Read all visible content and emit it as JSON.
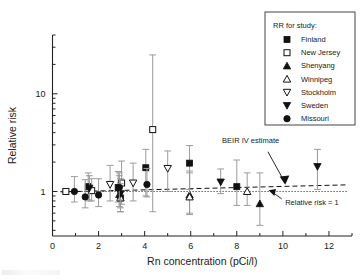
{
  "chart_data": {
    "type": "scatter",
    "title": "",
    "xlabel": "Rn concentration (pCi/l)",
    "ylabel": "Relative risk",
    "xlim": [
      0,
      13
    ],
    "ylim": [
      0.35,
      40
    ],
    "yscale": "log",
    "grid": false,
    "xticks": [
      0,
      2,
      4,
      6,
      8,
      10,
      12
    ],
    "xtick_labels": [
      "0",
      "2",
      "4",
      "6",
      "8",
      "10",
      "12"
    ],
    "yticks": [
      1,
      10
    ],
    "ytick_labels": [
      "1",
      "10"
    ],
    "legend": {
      "position": "top-right",
      "title": "RR for study:",
      "entries": [
        {
          "label": "Finland",
          "marker": "filled-square"
        },
        {
          "label": "New Jersey",
          "marker": "open-square"
        },
        {
          "label": "Shenyang",
          "marker": "filled-triangle-up"
        },
        {
          "label": "Winnipeg",
          "marker": "open-triangle-up"
        },
        {
          "label": "Stockholm",
          "marker": "open-triangle-down"
        },
        {
          "label": "Sweden",
          "marker": "filled-triangle-down"
        },
        {
          "label": "Missouri",
          "marker": "filled-circle"
        }
      ]
    },
    "annotations": [
      {
        "text": "BEIR IV estimate",
        "x": 8.6,
        "y": 3.1
      },
      {
        "text": "Relative risk = 1",
        "x": 10.1,
        "y": 0.72
      }
    ],
    "reference_lines": [
      {
        "name": "BEIR IV estimate",
        "style": "dashed",
        "x": [
          0.35,
          12.85
        ],
        "y": [
          0.99,
          1.17
        ]
      },
      {
        "name": "Relative risk = 1",
        "style": "dotted",
        "x": [
          0.35,
          12.85
        ],
        "y": [
          1.0,
          1.0
        ]
      }
    ],
    "series": [
      {
        "name": "Finland",
        "marker": "filled-square",
        "points": [
          {
            "x": 1.55,
            "y": 1.12,
            "lo": 0.82,
            "hi": 1.55
          },
          {
            "x": 2.85,
            "y": 1.1,
            "lo": 0.78,
            "hi": 1.6
          },
          {
            "x": 2.95,
            "y": 0.86,
            "lo": 0.62,
            "hi": 1.22
          },
          {
            "x": 4.05,
            "y": 1.75,
            "lo": 0.9,
            "hi": 2.7
          },
          {
            "x": 5.95,
            "y": 1.95,
            "lo": 1.05,
            "hi": 2.95
          },
          {
            "x": 8.0,
            "y": 1.12,
            "lo": 0.72,
            "hi": 2.1
          }
        ]
      },
      {
        "name": "New Jersey",
        "marker": "open-square",
        "points": [
          {
            "x": 0.58,
            "y": 1.0,
            "lo": 1.0,
            "hi": 1.0
          },
          {
            "x": 1.7,
            "y": 1.02,
            "lo": 0.8,
            "hi": 1.35
          },
          {
            "x": 3.0,
            "y": 1.22,
            "lo": 0.74,
            "hi": 2.05
          },
          {
            "x": 4.35,
            "y": 4.3,
            "lo": 0.62,
            "hi": 25.0
          }
        ]
      },
      {
        "name": "Shenyang",
        "marker": "filled-triangle-up",
        "points": [
          {
            "x": 2.9,
            "y": 0.93,
            "lo": 0.7,
            "hi": 1.45
          },
          {
            "x": 5.95,
            "y": 0.92,
            "lo": 0.58,
            "hi": 1.62
          },
          {
            "x": 9.0,
            "y": 0.75,
            "lo": 0.45,
            "hi": 1.55
          }
        ]
      },
      {
        "name": "Winnipeg",
        "marker": "open-triangle-up",
        "points": [
          {
            "x": 2.95,
            "y": 0.86,
            "lo": 0.62,
            "hi": 1.2
          },
          {
            "x": 5.95,
            "y": 0.88,
            "lo": 0.6,
            "hi": 1.55
          },
          {
            "x": 8.45,
            "y": 1.0,
            "lo": 0.72,
            "hi": 1.55
          }
        ]
      },
      {
        "name": "Stockholm",
        "marker": "open-triangle-down",
        "points": [
          {
            "x": 2.5,
            "y": 1.18,
            "lo": 0.8,
            "hi": 1.85
          },
          {
            "x": 3.5,
            "y": 1.22,
            "lo": 0.8,
            "hi": 1.95
          },
          {
            "x": 5.0,
            "y": 1.72,
            "lo": 1.0,
            "hi": 2.6
          }
        ]
      },
      {
        "name": "Sweden",
        "marker": "filled-triangle-down",
        "points": [
          {
            "x": 1.6,
            "y": 1.08,
            "lo": 0.8,
            "hi": 1.45
          },
          {
            "x": 2.95,
            "y": 0.95,
            "lo": 0.68,
            "hi": 1.35
          },
          {
            "x": 7.3,
            "y": 1.25,
            "lo": 0.95,
            "hi": 1.7
          },
          {
            "x": 11.5,
            "y": 1.8,
            "lo": 1.05,
            "hi": 2.7
          }
        ]
      },
      {
        "name": "Missouri",
        "marker": "filled-circle",
        "points": [
          {
            "x": 0.95,
            "y": 1.0,
            "lo": 0.78,
            "hi": 1.42
          },
          {
            "x": 1.42,
            "y": 0.88,
            "lo": 0.68,
            "hi": 1.32
          },
          {
            "x": 2.0,
            "y": 0.92,
            "lo": 0.7,
            "hi": 1.35
          },
          {
            "x": 2.9,
            "y": 1.1,
            "lo": 0.82,
            "hi": 1.55
          },
          {
            "x": 4.1,
            "y": 1.18,
            "lo": 0.88,
            "hi": 1.72
          }
        ]
      }
    ]
  }
}
